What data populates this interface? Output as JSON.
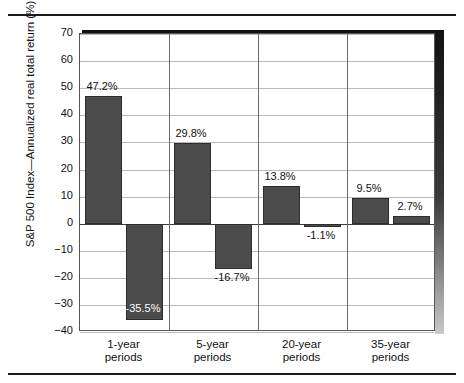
{
  "chart_data": {
    "type": "bar",
    "title": "",
    "subtitle": "",
    "xlabel": "",
    "ylabel": "S&P 500 Index—Annualized real total return (%)",
    "ylim": [
      -40,
      70
    ],
    "ytick_step": 10,
    "yticks": [
      "70",
      "60",
      "50",
      "40",
      "30",
      "20",
      "10",
      "0",
      "−10",
      "−20",
      "−30",
      "−40"
    ],
    "grid": true,
    "legend": "none",
    "bar_color": "#4b4b4b",
    "categories": [
      "1-year\nperiods",
      "5-year\nperiods",
      "20-year\nperiods",
      "35-year\nperiods"
    ],
    "category_lines": [
      [
        "1-year",
        "periods"
      ],
      [
        "5-year",
        "periods"
      ],
      [
        "20-year",
        "periods"
      ],
      [
        "35-year",
        "periods"
      ]
    ],
    "series": [
      {
        "name": "best",
        "values": [
          47.2,
          29.8,
          13.8,
          9.5
        ]
      },
      {
        "name": "worst",
        "values": [
          -35.5,
          -16.7,
          -1.1,
          2.7
        ]
      }
    ],
    "bars": [
      {
        "group": "1-year periods",
        "series": "best",
        "value": 47.2,
        "label": "47.2%",
        "label_position": "above",
        "label_inside": false
      },
      {
        "group": "1-year periods",
        "series": "worst",
        "value": -35.5,
        "label": "-35.5%",
        "label_position": "inside-bottom",
        "label_inside": true
      },
      {
        "group": "5-year periods",
        "series": "best",
        "value": 29.8,
        "label": "29.8%",
        "label_position": "above",
        "label_inside": false
      },
      {
        "group": "5-year periods",
        "series": "worst",
        "value": -16.7,
        "label": "-16.7%",
        "label_position": "below",
        "label_inside": false
      },
      {
        "group": "20-year periods",
        "series": "best",
        "value": 13.8,
        "label": "13.8%",
        "label_position": "above",
        "label_inside": false
      },
      {
        "group": "20-year periods",
        "series": "worst",
        "value": -1.1,
        "label": "-1.1%",
        "label_position": "below",
        "label_inside": false
      },
      {
        "group": "35-year periods",
        "series": "best",
        "value": 9.5,
        "label": "9.5%",
        "label_position": "above",
        "label_inside": false
      },
      {
        "group": "35-year periods",
        "series": "worst",
        "value": 2.7,
        "label": "2.7%",
        "label_position": "above",
        "label_inside": false
      }
    ]
  }
}
